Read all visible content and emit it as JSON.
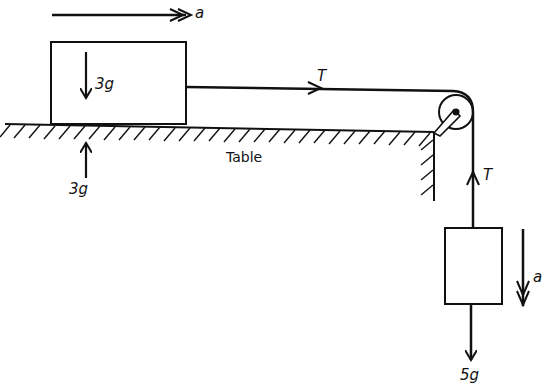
{
  "diagram": {
    "accel_top_label": "a",
    "block_top_weight_label": "3g",
    "normal_force_label": "3g",
    "table_label": "Table",
    "tension_horizontal_label": "T",
    "tension_vertical_label": "T",
    "accel_hanging_label": "a",
    "hanging_weight_label": "5g",
    "colors": {
      "ink": "#111111",
      "background": "#ffffff"
    }
  }
}
